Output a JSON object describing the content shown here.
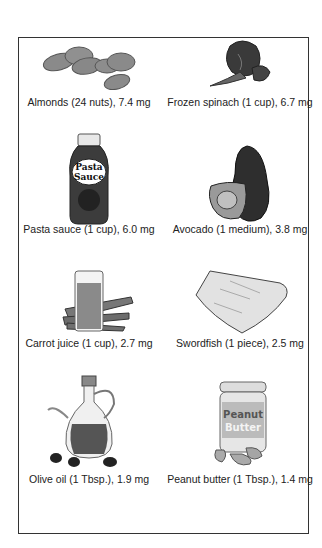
{
  "items": [
    {
      "label": "Almonds (24 nuts), 7.4 mg",
      "icon": "almonds-icon"
    },
    {
      "label": "Frozen spinach (1 cup), 6.7 mg",
      "icon": "spinach-icon"
    },
    {
      "label": "Pasta sauce (1 cup), 6.0 mg",
      "icon": "pasta-sauce-jar-icon",
      "jar_text": [
        "Pasta",
        "Sauce"
      ]
    },
    {
      "label": "Avocado (1 medium), 3.8 mg",
      "icon": "avocado-icon"
    },
    {
      "label": "Carrot juice (1 cup), 2.7 mg",
      "icon": "carrot-juice-icon"
    },
    {
      "label": "Swordfish (1 piece), 2.5 mg",
      "icon": "swordfish-icon"
    },
    {
      "label": "Olive oil (1 Tbsp.), 1.9 mg",
      "icon": "olive-oil-icon"
    },
    {
      "label": "Peanut butter (1 Tbsp.), 1.4 mg",
      "icon": "peanut-butter-jar-icon",
      "jar_text": [
        "Peanut",
        "Butter"
      ]
    }
  ]
}
